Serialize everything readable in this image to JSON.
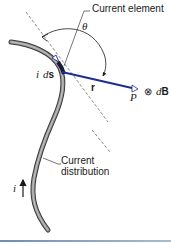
{
  "figure": {
    "labels": {
      "current_element": "Current element",
      "theta": "θ",
      "i": "i",
      "ds_d": "d",
      "ds_s": "s",
      "r": "r",
      "P": "P",
      "dB_symbol": "⊗",
      "dB_d": "d",
      "dB_B": "B",
      "current_distribution_line1": "Current",
      "current_distribution_line2": "distribution",
      "current_direction": "i"
    },
    "colors": {
      "wire": "#7a7a7a",
      "wire_edge": "#3a3a3a",
      "vector_r": "#1f2f8f",
      "text": "#1a1a1a",
      "dashed_line": "#555555",
      "rule": "#7f9cba"
    }
  }
}
